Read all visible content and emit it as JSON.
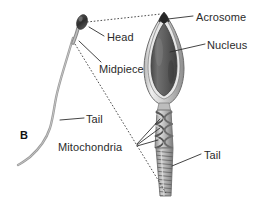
{
  "figure": {
    "panel_letter": "B",
    "background_color": "#ffffff",
    "text_color": "#2b2b2b",
    "line_color": "#3a3a3a",
    "cell_outline_color": "#6e6e6e",
    "nucleus_color": "#5d5d5d",
    "acrosome_color": "#2f2f2f",
    "membrane_color": "#c9c9c9",
    "midpiece_color": "#9a9a9a",
    "tail_color": "#8a8a8a"
  },
  "labels": [
    {
      "id": "acrosome",
      "text": "Acrosome",
      "x": 196,
      "y": 12
    },
    {
      "id": "nucleus",
      "text": "Nucleus",
      "x": 207,
      "y": 40
    },
    {
      "id": "head",
      "text": "Head",
      "x": 107,
      "y": 32
    },
    {
      "id": "midpiece",
      "text": "Midpiece",
      "x": 99,
      "y": 64
    },
    {
      "id": "tail-left",
      "text": "Tail",
      "x": 86,
      "y": 114
    },
    {
      "id": "mitochondria",
      "text": "Mitochondria",
      "x": 58,
      "y": 142
    },
    {
      "id": "tail-right",
      "text": "Tail",
      "x": 204,
      "y": 150
    }
  ],
  "structures": [
    {
      "id": "whole-sperm",
      "name": "whole sperm cell, small overview view"
    },
    {
      "id": "enlarged-sperm",
      "name": "enlarged longitudinal section of sperm"
    },
    {
      "id": "acrosome-cap",
      "name": "acrosome cap at anterior tip of head"
    },
    {
      "id": "nucleus-body",
      "name": "nucleus filling the head"
    },
    {
      "id": "mitochondria-coil",
      "name": "helical mitochondria of the midpiece"
    },
    {
      "id": "flagellum",
      "name": "striated flagellar tail"
    }
  ]
}
